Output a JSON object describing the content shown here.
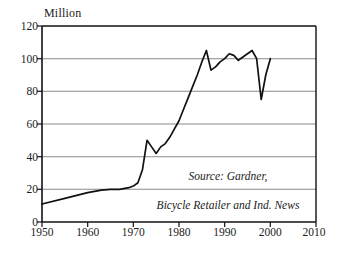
{
  "figure": {
    "unit_label": "Million",
    "background_color": "#ffffff",
    "frame_color": "#111111",
    "grid_color": "#8a8a8a",
    "line_color": "#111111"
  },
  "annotation": {
    "line1": "Source: Gardner,",
    "line2": "Bicycle Retailer and Ind. News"
  },
  "chart_data": {
    "type": "line",
    "title": "",
    "subtitle": "",
    "xlabel": "",
    "ylabel": "Million",
    "xlim": [
      1950,
      2010
    ],
    "ylim": [
      0,
      120
    ],
    "xticks": [
      1950,
      1960,
      1970,
      1980,
      1990,
      2000,
      2010
    ],
    "yticks": [
      0,
      20,
      40,
      60,
      80,
      100,
      120
    ],
    "xtick_labels": [
      "1950",
      "1960",
      "1970",
      "1980",
      "1990",
      "2000",
      "2010"
    ],
    "ytick_labels": [
      "0",
      "20",
      "40",
      "60",
      "80",
      "100",
      "120"
    ],
    "grid": "horizontal",
    "legend": "none",
    "annotations": [
      "Source: Gardner,",
      "Bicycle Retailer and Ind. News"
    ],
    "series": [
      {
        "name": "Bicycle sales",
        "x": [
          1950,
          1955,
          1960,
          1963,
          1965,
          1967,
          1969,
          1970,
          1971,
          1972,
          1973,
          1974,
          1975,
          1976,
          1977,
          1978,
          1979,
          1980,
          1981,
          1982,
          1983,
          1984,
          1985,
          1986,
          1987,
          1988,
          1989,
          1990,
          1991,
          1992,
          1993,
          1994,
          1995,
          1996,
          1997,
          1998,
          1999,
          2000
        ],
        "y": [
          11,
          14.5,
          18,
          19.5,
          20,
          20,
          21,
          22,
          24,
          32,
          50,
          46,
          42,
          46,
          48,
          52,
          57,
          62,
          69,
          76,
          83,
          90,
          98,
          105,
          93,
          95,
          98,
          100,
          103,
          102,
          99,
          101,
          103,
          105,
          100,
          75,
          90,
          100
        ]
      }
    ]
  }
}
